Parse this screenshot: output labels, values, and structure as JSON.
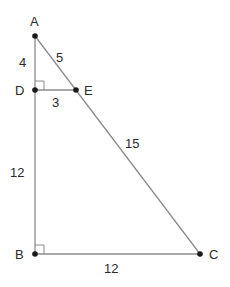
{
  "diagram": {
    "type": "geometry-similar-triangles",
    "line_color": "#8c8c8c",
    "point_color": "#1a1a1a",
    "points": {
      "A": {
        "label": "A",
        "x": 35,
        "y": 36
      },
      "D": {
        "label": "D",
        "x": 35,
        "y": 90
      },
      "E": {
        "label": "E",
        "x": 76,
        "y": 90
      },
      "B": {
        "label": "B",
        "x": 35,
        "y": 254
      },
      "C": {
        "label": "C",
        "x": 200,
        "y": 254
      }
    },
    "segments": [
      {
        "from": "A",
        "to": "B"
      },
      {
        "from": "A",
        "to": "C"
      },
      {
        "from": "D",
        "to": "E"
      },
      {
        "from": "B",
        "to": "C"
      }
    ],
    "right_angles": [
      "D",
      "B"
    ],
    "lengths": {
      "AD": "4",
      "AE": "5",
      "DE": "3",
      "EC": "15",
      "DB": "12",
      "BC": "12"
    }
  }
}
